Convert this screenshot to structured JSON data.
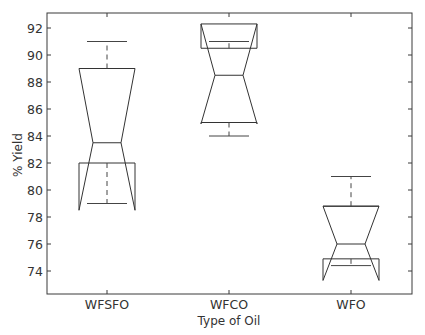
{
  "chart_data": {
    "type": "boxplot",
    "title": "",
    "xlabel": "Type of Oil",
    "ylabel": "% Yield",
    "ylim": [
      72.3,
      93.1
    ],
    "yticks": [
      74,
      76,
      78,
      80,
      82,
      84,
      86,
      88,
      90,
      92
    ],
    "ytick_labels": [
      "74",
      "76",
      "78",
      "80",
      "82",
      "84",
      "86",
      "88",
      "90",
      "92"
    ],
    "grid": false,
    "notched": true,
    "categories": [
      "WFSFO",
      "WFCO",
      "WFO"
    ],
    "series": [
      {
        "name": "WFSFO",
        "whisker_low": 79.0,
        "q1": 82.0,
        "median": 83.5,
        "q3": 89.0,
        "whisker_high": 91.0,
        "notch_low": 78.5,
        "notch_high": 88.5
      },
      {
        "name": "WFCO",
        "whisker_low": 84.0,
        "q1": 85.0,
        "median": 88.5,
        "q3": 90.5,
        "whisker_high": 91.0,
        "notch_low": 84.9,
        "notch_high": 92.3
      },
      {
        "name": "WFO",
        "whisker_low": 74.4,
        "q1": 74.9,
        "median": 76.0,
        "q3": 78.8,
        "whisker_high": 81.0,
        "notch_low": 73.3,
        "notch_high": 78.8
      }
    ]
  }
}
